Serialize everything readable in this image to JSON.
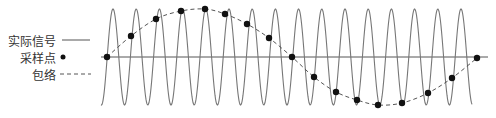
{
  "legend": {
    "items": [
      {
        "label": "实际信号",
        "style": "solid-line"
      },
      {
        "label": "采样点",
        "style": "dot"
      },
      {
        "label": "包络",
        "style": "dashed-line"
      }
    ]
  },
  "colors": {
    "signal": "#777777",
    "axis": "#555555",
    "envelope": "#555555",
    "points": "#111111",
    "text": "#333333"
  },
  "chart_data": {
    "type": "line",
    "title": "",
    "baseline_y": 57,
    "signal": {
      "name": "实际信号",
      "x_start": 101,
      "x_end": 472,
      "period_px": 23.2,
      "amplitude_px": 48,
      "peak_count": 16
    },
    "axis": {
      "x_start": 101,
      "x_end": 488
    },
    "samples": {
      "name": "采样点",
      "points": [
        [
          107,
          57
        ],
        [
          131,
          36
        ],
        [
          156,
          19
        ],
        [
          181,
          11
        ],
        [
          205,
          9
        ],
        [
          225,
          14
        ],
        [
          247,
          24
        ],
        [
          269,
          38
        ],
        [
          292,
          57
        ],
        [
          314,
          77
        ],
        [
          336,
          92
        ],
        [
          357,
          100
        ],
        [
          378,
          105
        ],
        [
          402,
          103
        ],
        [
          428,
          93
        ],
        [
          452,
          78
        ],
        [
          477,
          58
        ]
      ]
    },
    "envelope": {
      "name": "包络",
      "style": "dashed"
    }
  }
}
